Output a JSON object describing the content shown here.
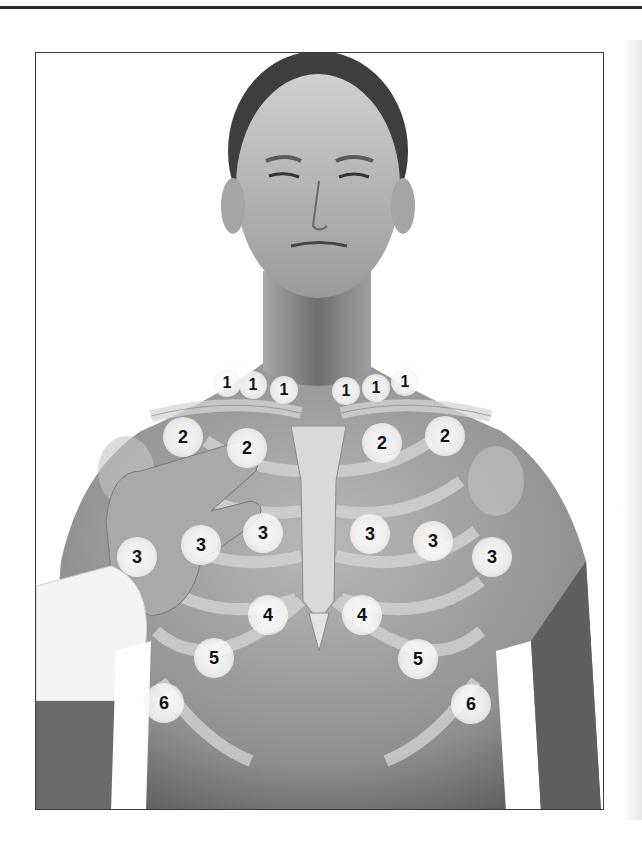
{
  "figure": {
    "colors": {
      "frame": "#3a3a3a",
      "marker_fill": "#f5f5f5",
      "marker_text": "#111111",
      "skin": "#9a9a9a",
      "background": "#ffffff"
    },
    "markers": [
      {
        "label": "1",
        "x": 227,
        "y": 383,
        "size": "small"
      },
      {
        "label": "1",
        "x": 253,
        "y": 385,
        "size": "small"
      },
      {
        "label": "1",
        "x": 284,
        "y": 390,
        "size": "small"
      },
      {
        "label": "1",
        "x": 346,
        "y": 391,
        "size": "small"
      },
      {
        "label": "1",
        "x": 376,
        "y": 388,
        "size": "small"
      },
      {
        "label": "1",
        "x": 405,
        "y": 382,
        "size": "small"
      },
      {
        "label": "2",
        "x": 183,
        "y": 437,
        "size": "large"
      },
      {
        "label": "2",
        "x": 247,
        "y": 448,
        "size": "large"
      },
      {
        "label": "2",
        "x": 382,
        "y": 443,
        "size": "large"
      },
      {
        "label": "2",
        "x": 445,
        "y": 436,
        "size": "large"
      },
      {
        "label": "3",
        "x": 137,
        "y": 557,
        "size": "large"
      },
      {
        "label": "3",
        "x": 201,
        "y": 545,
        "size": "large"
      },
      {
        "label": "3",
        "x": 263,
        "y": 533,
        "size": "large"
      },
      {
        "label": "3",
        "x": 370,
        "y": 534,
        "size": "large"
      },
      {
        "label": "3",
        "x": 433,
        "y": 541,
        "size": "large"
      },
      {
        "label": "3",
        "x": 492,
        "y": 557,
        "size": "large"
      },
      {
        "label": "4",
        "x": 268,
        "y": 615,
        "size": "large"
      },
      {
        "label": "4",
        "x": 362,
        "y": 615,
        "size": "large"
      },
      {
        "label": "5",
        "x": 214,
        "y": 658,
        "size": "large"
      },
      {
        "label": "5",
        "x": 418,
        "y": 659,
        "size": "large"
      },
      {
        "label": "6",
        "x": 164,
        "y": 703,
        "size": "large"
      },
      {
        "label": "6",
        "x": 471,
        "y": 704,
        "size": "large"
      }
    ]
  }
}
